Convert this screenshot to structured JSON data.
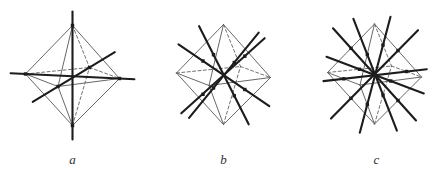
{
  "colors": {
    "background": "#ffffff",
    "ink": "#1c1c1c",
    "edge": "#565656",
    "edge_dashed": "#616161",
    "label": "#303030"
  },
  "figures": [
    {
      "label": "a",
      "label_x": 72.5,
      "label_y": 164,
      "kind": "axes-through-vertices",
      "solid_edges": [
        [
          72.5,
          25.5,
          25.5,
          74
        ],
        [
          72.5,
          25.5,
          119.5,
          78.5
        ],
        [
          72.5,
          25.5,
          58,
          86.5
        ],
        [
          72.5,
          125.5,
          25.5,
          74
        ],
        [
          72.5,
          125.5,
          119.5,
          78.5
        ],
        [
          72.5,
          125.5,
          58,
          86.5
        ],
        [
          25.5,
          74,
          58,
          86.5
        ],
        [
          58,
          86.5,
          119.5,
          78.5
        ]
      ],
      "dashed_edges": [
        [
          72.5,
          25.5,
          89.5,
          67.5
        ],
        [
          72.5,
          125.5,
          89.5,
          67.5
        ],
        [
          25.5,
          74,
          89.5,
          67.5
        ],
        [
          89.5,
          67.5,
          119.5,
          78.5
        ]
      ],
      "axes": [
        [
          72.5,
          11.5,
          72.5,
          139.5
        ],
        [
          10.6,
          73.3,
          134.4,
          79.2
        ],
        [
          32.7,
          101.8,
          114.8,
          52.2
        ]
      ],
      "dots": [
        [
          72.5,
          25.5
        ],
        [
          72.5,
          125.5
        ],
        [
          25.5,
          74
        ],
        [
          119.5,
          78.5
        ],
        [
          58,
          86.5
        ],
        [
          89.5,
          67.5
        ]
      ]
    },
    {
      "label": "b",
      "label_x": 223.5,
      "label_y": 164,
      "kind": "axes-through-face-centers",
      "solid_edges": [
        [
          223.5,
          24.5,
          176.5,
          73
        ],
        [
          223.5,
          24.5,
          270.5,
          77.5
        ],
        [
          223.5,
          24.5,
          209,
          85.5
        ],
        [
          223.5,
          124.5,
          176.5,
          73
        ],
        [
          223.5,
          124.5,
          270.5,
          77.5
        ],
        [
          223.5,
          124.5,
          209,
          85.5
        ],
        [
          176.5,
          73,
          209,
          85.5
        ],
        [
          209,
          85.5,
          270.5,
          77.5
        ]
      ],
      "dashed_edges": [
        [
          223.5,
          24.5,
          240.5,
          66.5
        ],
        [
          223.5,
          124.5,
          240.5,
          66.5
        ],
        [
          176.5,
          73,
          240.5,
          66.5
        ],
        [
          240.5,
          66.5,
          270.5,
          77.5
        ]
      ],
      "axes": [
        [
          178.5,
          44.3,
          269.3,
          106.2
        ],
        [
          258.7,
          32.6,
          189.1,
          117.9
        ],
        [
          199.1,
          26.2,
          248.7,
          124.3
        ],
        [
          264.6,
          38.2,
          181.3,
          113.3
        ]
      ],
      "dots": [
        [
          203,
          61
        ],
        [
          244.8,
          89.5
        ],
        [
          234.3,
          62.5
        ],
        [
          213.5,
          88
        ],
        [
          213.5,
          54.7
        ],
        [
          234.3,
          95.8
        ],
        [
          244.8,
          56.2
        ],
        [
          203,
          94.3
        ]
      ]
    },
    {
      "label": "c",
      "label_x": 376.5,
      "label_y": 164,
      "kind": "axes-through-edge-midpoints",
      "solid_edges": [
        [
          374.5,
          24,
          327.5,
          72.5
        ],
        [
          374.5,
          24,
          421.5,
          77
        ],
        [
          374.5,
          24,
          360,
          85
        ],
        [
          374.5,
          124,
          327.5,
          72.5
        ],
        [
          374.5,
          124,
          421.5,
          77
        ],
        [
          374.5,
          124,
          360,
          85
        ],
        [
          327.5,
          72.5,
          360,
          85
        ],
        [
          360,
          85,
          421.5,
          77
        ]
      ],
      "dashed_edges": [
        [
          374.5,
          24,
          391.5,
          66
        ],
        [
          374.5,
          124,
          391.5,
          66
        ],
        [
          327.5,
          72.5,
          391.5,
          66
        ],
        [
          391.5,
          66,
          421.5,
          77
        ]
      ],
      "axes": [
        [
          333,
          28.3,
          416,
          120.5
        ],
        [
          418,
          30.2,
          331,
          118.6
        ],
        [
          353.4,
          18.8,
          396.9,
          130.7
        ],
        [
          390.5,
          16.7,
          359.8,
          132.8
        ],
        [
          323.5,
          81.1,
          426.8,
          69.2
        ],
        [
          423.8,
          93.4,
          326.5,
          56.8
        ]
      ],
      "dots": [
        [
          351,
          48.3
        ],
        [
          398,
          100.5
        ],
        [
          398,
          50.5
        ],
        [
          351,
          98.3
        ],
        [
          367.3,
          54.5
        ],
        [
          383,
          95
        ],
        [
          383,
          45
        ],
        [
          367.3,
          104.5
        ],
        [
          343.8,
          78.8
        ],
        [
          406.5,
          71.5
        ],
        [
          390.8,
          81
        ],
        [
          359.5,
          69.3
        ]
      ]
    }
  ]
}
